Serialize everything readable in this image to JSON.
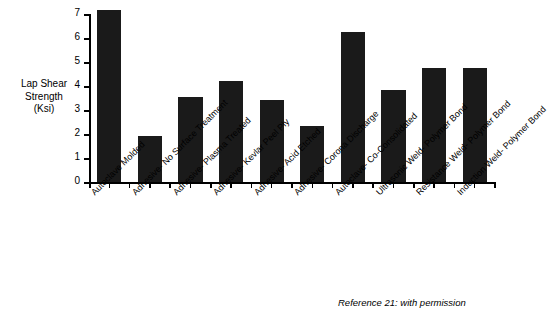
{
  "chart_data": {
    "type": "bar",
    "title": "",
    "xlabel": "",
    "ylabel": "Lap Shear Strength (Ksi)",
    "ylim": [
      0,
      7
    ],
    "yticks": [
      0,
      1,
      2,
      3,
      4,
      5,
      6,
      7
    ],
    "grid": false,
    "legend": null,
    "bar_color": "#1a1a1a",
    "categories": [
      "Autoclave Molded",
      "Adhesive- No Surface Treatment",
      "Adhesive- Plasma Treated",
      "Adhesive- Kevlar Peel Ply",
      "Adhesive- Acid Etched",
      "Adhesive- Corona Discharge",
      "Autoclave- Co-Consolidated",
      "Ultrasonic Weld- Polymer Bond",
      "Resistance Weld- Polymer Bond",
      "Induction Weld- Polymer Bond"
    ],
    "values": [
      7.15,
      1.9,
      3.55,
      4.2,
      3.4,
      2.35,
      6.25,
      3.85,
      4.75,
      4.75
    ],
    "annotations": [
      "Reference 21: with permission"
    ]
  },
  "axis": {
    "y_title_line1": "Lap Shear",
    "y_title_line2": "Strength",
    "y_title_line3": "(Ksi)",
    "tick_labels": [
      "7",
      "6",
      "5",
      "4",
      "3",
      "2",
      "1",
      "0"
    ]
  },
  "footnote": {
    "text": "Reference 21: with permission"
  }
}
